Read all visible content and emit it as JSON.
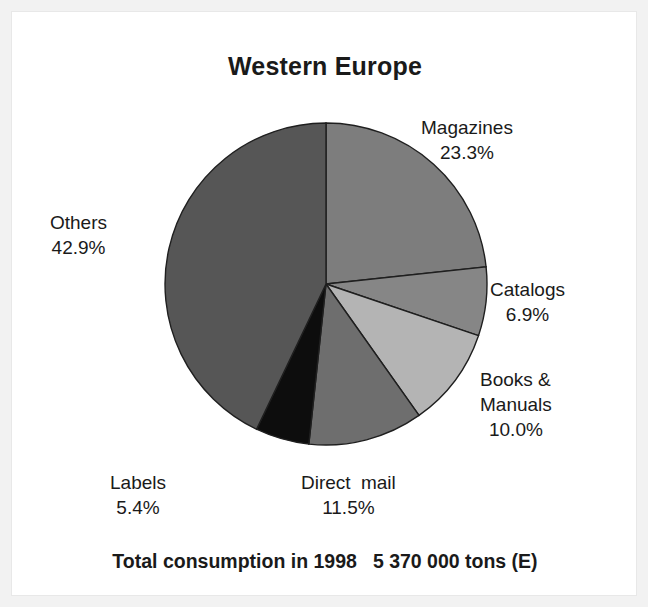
{
  "chart_data": {
    "type": "pie",
    "title": "Western Europe",
    "subtitle": "",
    "xlabel": "",
    "ylabel": "",
    "legend_position": "none",
    "grid": false,
    "units": "percent of total consumption",
    "footnote_label": "Total consumption in 1998",
    "footnote_value": "5 370 000 tons (E)",
    "categories": [
      "Magazines",
      "Catalogs",
      "Books & Manuals",
      "Direct mail",
      "Labels",
      "Others"
    ],
    "values": [
      23.3,
      6.9,
      10.0,
      11.5,
      5.4,
      42.9
    ],
    "slices": [
      {
        "name": "Magazines",
        "label": "Magazines",
        "value": 23.3,
        "pct_text": "23.3%",
        "color": "#7d7d7d"
      },
      {
        "name": "Catalogs",
        "label": "Catalogs",
        "value": 6.9,
        "pct_text": "6.9%",
        "color": "#868686"
      },
      {
        "name": "Books & Manuals",
        "label_line1": "Books &",
        "label_line2": "Manuals",
        "value": 10.0,
        "pct_text": "10.0%",
        "color": "#b4b4b4"
      },
      {
        "name": "Direct mail",
        "label_a": "Direct",
        "label_b": "mail",
        "value": 11.5,
        "pct_text": "11.5%",
        "color": "#6e6e6e"
      },
      {
        "name": "Labels",
        "label": "Labels",
        "value": 5.4,
        "pct_text": "5.4%",
        "color": "#0d0d0d"
      },
      {
        "name": "Others",
        "label": "Others",
        "value": 42.9,
        "pct_text": "42.9%",
        "color": "#565656"
      }
    ]
  },
  "chart": {
    "title": "Western Europe",
    "footer_label": "Total consumption in 1998",
    "footer_value": "5 370 000 tons (E)"
  },
  "labels": {
    "magazines_name": "Magazines",
    "magazines_pct": "23.3%",
    "catalogs_name": "Catalogs",
    "catalogs_pct": "6.9%",
    "books_line1": "Books &",
    "books_line2": "Manuals",
    "books_pct": "10.0%",
    "direct_a": "Direct",
    "direct_b": "mail",
    "direct_pct": "11.5%",
    "labels_name": "Labels",
    "labels_pct": "5.4%",
    "others_name": "Others",
    "others_pct": "42.9%"
  },
  "colors": {
    "page_border": "#f2f2f2",
    "plot_background": "#ffffff",
    "text": "#1a1a1a",
    "slice_outline": "#1f1f1f"
  }
}
